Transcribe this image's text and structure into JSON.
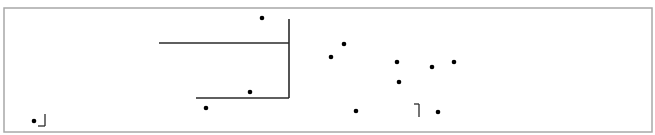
{
  "diagram": {
    "width": 655,
    "height": 135,
    "colors": {
      "background": "#ffffff",
      "frame": "#a8a8a8",
      "line": "#2a2a2a",
      "dot": "#000000"
    },
    "frame": {
      "x": 4,
      "y": 8,
      "width": 648,
      "height": 124
    },
    "lines": [
      {
        "id": "upper-horizontal",
        "x1": 159,
        "y1": 43,
        "x2": 289,
        "y2": 43
      },
      {
        "id": "vertical",
        "x1": 289,
        "y1": 19,
        "x2": 289,
        "y2": 98
      },
      {
        "id": "lower-horizontal",
        "x1": 196,
        "y1": 98,
        "x2": 289,
        "y2": 98
      }
    ],
    "dots": [
      {
        "x": 262,
        "y": 18
      },
      {
        "x": 250,
        "y": 92
      },
      {
        "x": 206,
        "y": 108
      },
      {
        "x": 34,
        "y": 121
      },
      {
        "x": 344,
        "y": 44
      },
      {
        "x": 331,
        "y": 57
      },
      {
        "x": 397,
        "y": 62
      },
      {
        "x": 432,
        "y": 67
      },
      {
        "x": 454,
        "y": 62
      },
      {
        "x": 399,
        "y": 82
      },
      {
        "x": 356,
        "y": 111
      },
      {
        "x": 438,
        "y": 112
      }
    ],
    "corner_marks": [
      {
        "id": "bottom-right-corner-mark",
        "glyph": "┘",
        "x": 37,
        "y": 114,
        "lines": [
          {
            "x1": 45,
            "y1": 114,
            "x2": 45,
            "y2": 126
          },
          {
            "x1": 38,
            "y1": 126,
            "x2": 45,
            "y2": 126
          }
        ]
      },
      {
        "id": "top-right-corner-mark",
        "glyph": "┐",
        "x": 414,
        "y": 104,
        "lines": [
          {
            "x1": 414,
            "y1": 104,
            "x2": 419,
            "y2": 104
          },
          {
            "x1": 419,
            "y1": 104,
            "x2": 419,
            "y2": 117
          }
        ]
      }
    ]
  }
}
